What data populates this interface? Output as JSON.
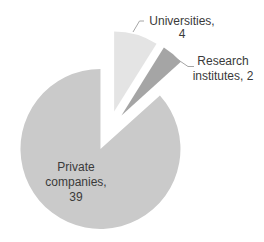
{
  "chart_data": {
    "type": "pie",
    "title": "",
    "categories": [
      "Universities",
      "Research institutes",
      "Private companies"
    ],
    "values": [
      4,
      2,
      39
    ],
    "total": 45,
    "slices": [
      {
        "id": "universities",
        "category": "Universities",
        "value": 4,
        "color": "#e4e4e4",
        "label_lines": [
          "Universities,",
          "4"
        ]
      },
      {
        "id": "research-institutes",
        "category": "Research institutes",
        "value": 2,
        "color": "#a5a5a5",
        "label_lines": [
          "Research",
          "institutes, 2"
        ]
      },
      {
        "id": "private-companies",
        "category": "Private companies",
        "value": 39,
        "color": "#cacaca",
        "label_lines": [
          "Private",
          "companies,",
          "39"
        ]
      }
    ],
    "start_angle_deg": 0,
    "direction": "clockwise",
    "explosion_pct": 25,
    "legend_position": "none",
    "grid": "off",
    "background_color": "#ffffff",
    "label_color": "#3a3a3a",
    "leader_line_color": "#a6a6a6"
  }
}
